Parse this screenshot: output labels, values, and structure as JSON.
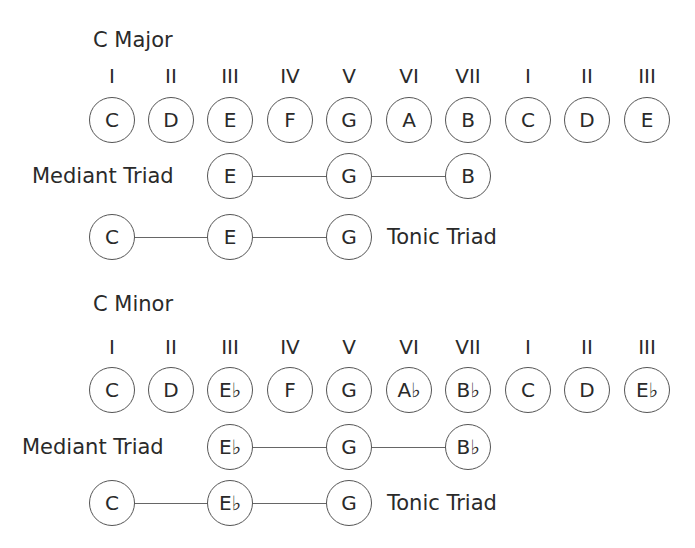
{
  "sections": [
    {
      "title": "C Major",
      "numerals": [
        "I",
        "II",
        "III",
        "IV",
        "V",
        "VI",
        "VII",
        "I",
        "II",
        "III"
      ],
      "notes": [
        "C",
        "D",
        "E",
        "F",
        "G",
        "A",
        "B",
        "C",
        "D",
        "E"
      ],
      "mediant_triad": {
        "label": "Mediant Triad",
        "notes": [
          "E",
          "G",
          "B"
        ]
      },
      "tonic_triad": {
        "label": "Tonic Triad",
        "notes": [
          "C",
          "E",
          "G"
        ]
      }
    },
    {
      "title": "C Minor",
      "numerals": [
        "I",
        "II",
        "III",
        "IV",
        "V",
        "VI",
        "VII",
        "I",
        "II",
        "III"
      ],
      "notes": [
        "C",
        "D",
        "E♭",
        "F",
        "G",
        "A♭",
        "B♭",
        "C",
        "D",
        "E♭"
      ],
      "mediant_triad": {
        "label": "Mediant Triad",
        "notes": [
          "E♭",
          "G",
          "B♭"
        ]
      },
      "tonic_triad": {
        "label": "Tonic Triad",
        "notes": [
          "C",
          "E♭",
          "G"
        ]
      }
    }
  ],
  "colors": {
    "text": "#2a2a2a",
    "circle_stroke": "#555555",
    "line": "#666666",
    "background": "#ffffff"
  }
}
